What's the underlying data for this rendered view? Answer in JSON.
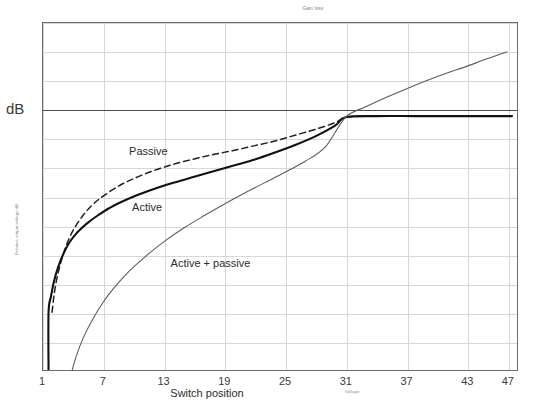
{
  "chart_data": {
    "type": "line",
    "title": "Gain loss",
    "xlabel": "Switch position",
    "xlabel_sub": "Voltage",
    "ylabel": "Relative output voltage dB",
    "y_unit_prefix": "dB",
    "xlim": [
      1,
      48
    ],
    "ylim": [
      -45,
      15
    ],
    "xticks": [
      1,
      7,
      13,
      19,
      25,
      31,
      37,
      43,
      47
    ],
    "yticks": [
      15,
      10,
      5,
      0,
      -5,
      -10,
      -15,
      -20,
      -25,
      -30,
      -35,
      -40,
      -45
    ],
    "grid": true,
    "legend_position": "inline-annotations",
    "zero_reference_line": 0,
    "series": [
      {
        "name": "Passive",
        "style": "dashed",
        "color": "#1f1f1f",
        "width": 1.5,
        "label_x": 9.5,
        "label_y": -7.2,
        "x": [
          1.9,
          2.1,
          2.4,
          2.8,
          3.3,
          4.0,
          5.0,
          6.0,
          7.0,
          8.5,
          10.0,
          12.0,
          14.0,
          16.0,
          18.0,
          20.0,
          22.0,
          24.0,
          26.0,
          28.0,
          30.0,
          31.0,
          33.0,
          36.0,
          40.0,
          44.0,
          47.5
        ],
        "y": [
          -35.0,
          -32.0,
          -29.0,
          -26.2,
          -23.5,
          -20.8,
          -18.2,
          -16.3,
          -14.9,
          -13.2,
          -11.9,
          -10.5,
          -9.4,
          -8.5,
          -7.7,
          -7.0,
          -6.2,
          -5.4,
          -4.4,
          -3.4,
          -2.2,
          -1.3,
          -1.1,
          -1.1,
          -1.1,
          -1.1,
          -1.1
        ]
      },
      {
        "name": "Active",
        "style": "solid",
        "color": "#111111",
        "width": 2.1,
        "label_x": 9.8,
        "label_y": -16.8,
        "x": [
          1.55,
          1.55,
          1.8,
          2.1,
          2.5,
          3.0,
          3.6,
          4.4,
          5.4,
          6.5,
          8.0,
          10.0,
          12.0,
          14.0,
          16.0,
          18.0,
          20.0,
          22.0,
          24.0,
          26.0,
          28.0,
          30.0,
          31.0,
          34.0,
          38.0,
          43.0,
          47.5
        ],
        "y": [
          -45.0,
          -35.0,
          -32.2,
          -29.6,
          -27.2,
          -25.0,
          -23.0,
          -21.2,
          -19.6,
          -18.2,
          -16.6,
          -15.0,
          -13.7,
          -12.6,
          -11.6,
          -10.6,
          -9.6,
          -8.6,
          -7.4,
          -6.1,
          -4.6,
          -2.7,
          -1.3,
          -1.1,
          -1.1,
          -1.1,
          -1.1
        ]
      },
      {
        "name": "Active + passive",
        "style": "solid",
        "color": "#5c5c5c",
        "width": 1.1,
        "label_x": 13.6,
        "label_y": -26.4,
        "x": [
          3.9,
          4.3,
          5.0,
          6.0,
          7.0,
          8.0,
          9.5,
          11.0,
          13.0,
          15.0,
          17.0,
          19.0,
          21.0,
          23.0,
          25.0,
          27.0,
          29.0,
          31.0,
          33.0,
          35.0,
          37.0,
          39.0,
          41.0,
          43.0,
          45.0,
          47.0
        ],
        "y": [
          -45.0,
          -42.6,
          -39.4,
          -36.0,
          -33.2,
          -30.9,
          -28.0,
          -25.6,
          -22.8,
          -20.4,
          -18.3,
          -16.3,
          -14.4,
          -12.6,
          -10.8,
          -8.9,
          -6.4,
          -1.3,
          0.5,
          2.1,
          3.6,
          5.0,
          6.3,
          7.5,
          8.8,
          10.0
        ]
      }
    ]
  }
}
